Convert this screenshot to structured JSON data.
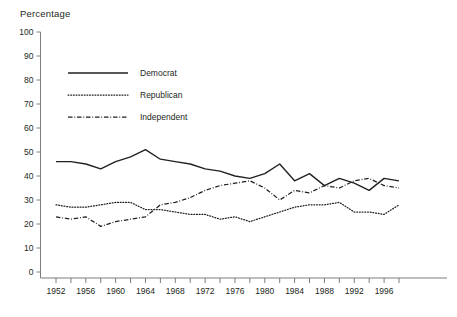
{
  "chart_data": {
    "type": "line",
    "title": "",
    "ylabel": "Percentage",
    "xlabel": "",
    "ylim": [
      0,
      100
    ],
    "yticks": [
      0,
      10,
      20,
      30,
      40,
      50,
      60,
      70,
      80,
      90,
      100
    ],
    "xlim": [
      1952,
      1998
    ],
    "xticks": [
      1952,
      1954,
      1956,
      1958,
      1960,
      1962,
      1964,
      1966,
      1968,
      1970,
      1972,
      1974,
      1976,
      1978,
      1980,
      1982,
      1984,
      1986,
      1988,
      1990,
      1992,
      1994,
      1996,
      1998
    ],
    "xtick_labels": [
      "1952",
      "",
      "1956",
      "",
      "1960",
      "",
      "1964",
      "",
      "1968",
      "",
      "1972",
      "",
      "1976",
      "",
      "1980",
      "",
      "1984",
      "",
      "1988",
      "",
      "1992",
      "",
      "1996",
      ""
    ],
    "grid": false,
    "legend_position": "upper-left-inside",
    "x": [
      1952,
      1954,
      1956,
      1958,
      1960,
      1962,
      1964,
      1966,
      1968,
      1970,
      1972,
      1974,
      1976,
      1978,
      1980,
      1982,
      1984,
      1986,
      1988,
      1990,
      1992,
      1994,
      1996,
      1998
    ],
    "series": [
      {
        "name": "Democrat",
        "style": "solid",
        "values": [
          46,
          46,
          45,
          43,
          46,
          48,
          51,
          47,
          46,
          45,
          43,
          42,
          40,
          39,
          41,
          45,
          38,
          41,
          36,
          39,
          37,
          34,
          39,
          38
        ]
      },
      {
        "name": "Republican",
        "style": "dotted",
        "values": [
          28,
          27,
          27,
          28,
          29,
          29,
          26,
          26,
          25,
          24,
          24,
          22,
          23,
          21,
          23,
          25,
          27,
          28,
          28,
          29,
          25,
          25,
          24,
          28
        ]
      },
      {
        "name": "Independent",
        "style": "dash-dot",
        "values": [
          23,
          22,
          23,
          19,
          21,
          22,
          23,
          28,
          29,
          31,
          34,
          36,
          37,
          38,
          35,
          30,
          34,
          33,
          36,
          35,
          38,
          39,
          36,
          35
        ]
      }
    ]
  },
  "legend": {
    "items": [
      {
        "label": "Democrat",
        "style": "solid"
      },
      {
        "label": "Republican",
        "style": "dotted"
      },
      {
        "label": "Independent",
        "style": "dash-dot"
      }
    ]
  },
  "colors": {
    "line": "#231f20",
    "axis": "#6d6e71",
    "background": "#ffffff"
  }
}
